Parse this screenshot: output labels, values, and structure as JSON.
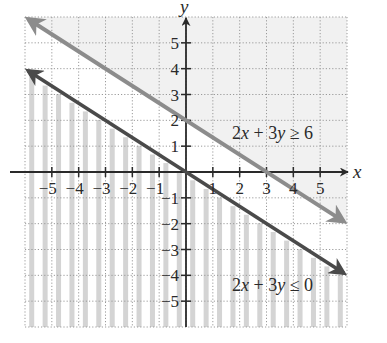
{
  "chart_data": {
    "type": "line",
    "title": "",
    "xlabel": "x",
    "ylabel": "y",
    "xlim": [
      -6,
      6
    ],
    "ylim": [
      -6,
      6
    ],
    "grid": true,
    "grid_style": "dotted",
    "x_ticks": [
      -5,
      -4,
      -3,
      -2,
      -1,
      1,
      2,
      3,
      4,
      5
    ],
    "y_ticks": [
      5,
      4,
      3,
      2,
      1,
      -1,
      -2,
      -3,
      -4,
      -5
    ],
    "x_tick_labels": [
      "−5",
      "−4",
      "−3",
      "−2",
      "−1",
      "1",
      "2",
      "3",
      "4",
      "5"
    ],
    "y_tick_labels": [
      "5",
      "4",
      "3",
      "2",
      "1",
      "−1",
      "−2",
      "−3",
      "−4",
      "−5"
    ],
    "series": [
      {
        "name": "2x + 3y = 6",
        "label": "2x + 3y ≥ 6",
        "equation": "y = 2 - 2x/3",
        "x": [
          -6,
          6
        ],
        "y": [
          6,
          -2
        ],
        "color": "#8c8c8c",
        "arrows": "both",
        "shade": "above",
        "shade_style": "light-solid"
      },
      {
        "name": "2x + 3y = 0",
        "label": "2x + 3y ≤ 0",
        "equation": "y = -2x/3",
        "x": [
          -6,
          6
        ],
        "y": [
          4,
          -4
        ],
        "color": "#4a4a4a",
        "arrows": "both",
        "shade": "below",
        "shade_style": "vertical-stripes"
      }
    ],
    "annotations": [
      {
        "text": "2x + 3y ≥ 6",
        "x": 3.5,
        "y": 0.9
      },
      {
        "text": "2x + 3y ≤ 0",
        "x": 3.5,
        "y": -4.5
      }
    ]
  },
  "labels": {
    "x_axis": "x",
    "y_axis": "y",
    "ineq_upper": {
      "num1": "2",
      "var1": "x",
      "op": " + 3",
      "var2": "y",
      "rel": " ≥ 6"
    },
    "ineq_lower": {
      "num1": "2",
      "var1": "x",
      "op": " + 3",
      "var2": "y",
      "rel": " ≤ 0"
    }
  },
  "colors": {
    "grid": "#9a9a9a",
    "axis": "#2a2a2a",
    "line_upper": "#8c8c8c",
    "line_lower": "#4a4a4a",
    "shade_stripe": "#d4d4d4",
    "shade_upper": "#f1f1f1"
  }
}
